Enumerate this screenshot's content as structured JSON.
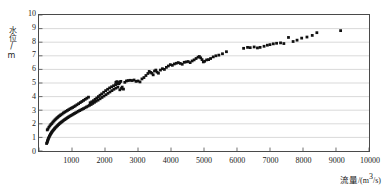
{
  "chart_data": {
    "type": "scatter",
    "title": "",
    "xlabel": "流量 /(m³/s)",
    "ylabel": "水位/m",
    "xlim": [
      0,
      10000
    ],
    "ylim": [
      0,
      10
    ],
    "xticks": [
      0,
      1000,
      2000,
      3000,
      4000,
      5000,
      6000,
      7000,
      8000,
      9000,
      10000
    ],
    "xtick_labels": [
      "0",
      "1000",
      "2000",
      "3000",
      "4000",
      "5000",
      "6000",
      "7000",
      "8000",
      "9000",
      "10000"
    ],
    "yticks": [
      0,
      1,
      2,
      3,
      4,
      5,
      6,
      7,
      8,
      9,
      10
    ],
    "ytick_labels": [
      "0",
      "1",
      "2",
      "3",
      "4",
      "5",
      "6",
      "7",
      "8",
      "9",
      "10"
    ],
    "grid": "horizontal",
    "grid_color": "#c8c8c8",
    "marker_color": "#111111",
    "marker_size": 1.4,
    "legend": null,
    "annotations": [],
    "series": [
      {
        "name": "rising-limb",
        "points": [
          [
            250,
            1.55
          ],
          [
            270,
            1.62
          ],
          [
            300,
            1.75
          ],
          [
            330,
            1.85
          ],
          [
            360,
            1.95
          ],
          [
            390,
            2.02
          ],
          [
            420,
            2.12
          ],
          [
            450,
            2.2
          ],
          [
            480,
            2.28
          ],
          [
            510,
            2.35
          ],
          [
            540,
            2.42
          ],
          [
            570,
            2.48
          ],
          [
            600,
            2.55
          ],
          [
            630,
            2.6
          ],
          [
            660,
            2.66
          ],
          [
            700,
            2.72
          ],
          [
            740,
            2.8
          ],
          [
            780,
            2.86
          ],
          [
            820,
            2.92
          ],
          [
            860,
            2.98
          ],
          [
            900,
            3.04
          ],
          [
            940,
            3.1
          ],
          [
            980,
            3.15
          ],
          [
            1020,
            3.2
          ],
          [
            1060,
            3.26
          ],
          [
            1100,
            3.32
          ],
          [
            1150,
            3.4
          ],
          [
            1200,
            3.48
          ],
          [
            1250,
            3.56
          ],
          [
            1300,
            3.64
          ],
          [
            1350,
            3.72
          ],
          [
            1400,
            3.8
          ],
          [
            1450,
            3.88
          ],
          [
            1500,
            3.96
          ],
          [
            1550,
            3.55
          ],
          [
            1600,
            3.62
          ],
          [
            1650,
            3.7
          ],
          [
            1700,
            3.8
          ],
          [
            1750,
            3.9
          ],
          [
            1800,
            4.0
          ],
          [
            1850,
            4.1
          ],
          [
            1900,
            4.2
          ],
          [
            1960,
            4.32
          ],
          [
            2020,
            4.44
          ],
          [
            2080,
            4.54
          ],
          [
            2140,
            4.64
          ],
          [
            2200,
            4.72
          ],
          [
            2260,
            4.8
          ],
          [
            2320,
            4.88
          ],
          [
            2380,
            4.95
          ],
          [
            2440,
            5.02
          ]
        ]
      },
      {
        "name": "falling-limb",
        "points": [
          [
            230,
            0.55
          ],
          [
            245,
            0.62
          ],
          [
            255,
            0.7
          ],
          [
            265,
            0.78
          ],
          [
            275,
            0.85
          ],
          [
            285,
            0.92
          ],
          [
            300,
            1.0
          ],
          [
            315,
            1.08
          ],
          [
            330,
            1.15
          ],
          [
            345,
            1.22
          ],
          [
            360,
            1.28
          ],
          [
            375,
            1.34
          ],
          [
            390,
            1.4
          ],
          [
            410,
            1.46
          ],
          [
            430,
            1.52
          ],
          [
            450,
            1.58
          ],
          [
            470,
            1.64
          ],
          [
            490,
            1.7
          ],
          [
            515,
            1.76
          ],
          [
            540,
            1.82
          ],
          [
            565,
            1.88
          ],
          [
            590,
            1.94
          ],
          [
            615,
            2.0
          ],
          [
            640,
            2.05
          ],
          [
            665,
            2.1
          ],
          [
            690,
            2.15
          ],
          [
            720,
            2.2
          ],
          [
            750,
            2.26
          ],
          [
            780,
            2.31
          ],
          [
            810,
            2.36
          ],
          [
            840,
            2.41
          ],
          [
            870,
            2.46
          ],
          [
            900,
            2.51
          ],
          [
            935,
            2.56
          ],
          [
            970,
            2.61
          ],
          [
            1005,
            2.66
          ],
          [
            1040,
            2.71
          ],
          [
            1075,
            2.76
          ],
          [
            1110,
            2.81
          ],
          [
            1150,
            2.86
          ],
          [
            1190,
            2.92
          ],
          [
            1230,
            2.97
          ],
          [
            1270,
            3.02
          ],
          [
            1310,
            3.07
          ],
          [
            1350,
            3.12
          ],
          [
            1395,
            3.18
          ],
          [
            1440,
            3.24
          ],
          [
            1485,
            3.3
          ],
          [
            1530,
            3.36
          ],
          [
            1580,
            3.42
          ],
          [
            1630,
            3.5
          ],
          [
            1680,
            3.58
          ],
          [
            1730,
            3.66
          ],
          [
            1790,
            3.74
          ],
          [
            1850,
            3.84
          ],
          [
            1910,
            3.94
          ],
          [
            1970,
            4.04
          ],
          [
            2030,
            4.14
          ],
          [
            2090,
            4.24
          ],
          [
            2150,
            4.34
          ],
          [
            2210,
            4.44
          ],
          [
            2270,
            4.54
          ],
          [
            2330,
            4.62
          ],
          [
            2390,
            4.7
          ],
          [
            2450,
            4.5
          ],
          [
            2500,
            4.6
          ]
        ]
      },
      {
        "name": "main-rating-curve",
        "points": [
          [
            2330,
            5.05
          ],
          [
            2360,
            5.1
          ],
          [
            2390,
            5.02
          ],
          [
            2420,
            4.95
          ],
          [
            2450,
            5.08
          ],
          [
            2480,
            5.12
          ],
          [
            2520,
            4.7
          ],
          [
            2560,
            4.55
          ],
          [
            2600,
            5.05
          ],
          [
            2650,
            5.15
          ],
          [
            2700,
            5.18
          ],
          [
            2760,
            5.2
          ],
          [
            2820,
            5.18
          ],
          [
            2880,
            5.22
          ],
          [
            2940,
            5.12
          ],
          [
            3000,
            5.15
          ],
          [
            3060,
            5.08
          ],
          [
            3120,
            5.3
          ],
          [
            3180,
            5.4
          ],
          [
            3240,
            5.55
          ],
          [
            3300,
            5.7
          ],
          [
            3340,
            5.85
          ],
          [
            3380,
            5.78
          ],
          [
            3420,
            5.72
          ],
          [
            3460,
            5.6
          ],
          [
            3500,
            5.88
          ],
          [
            3540,
            5.95
          ],
          [
            3580,
            5.8
          ],
          [
            3620,
            5.72
          ],
          [
            3680,
            5.95
          ],
          [
            3740,
            6.05
          ],
          [
            3800,
            6.0
          ],
          [
            3860,
            6.15
          ],
          [
            3920,
            6.25
          ],
          [
            3980,
            6.35
          ],
          [
            4040,
            6.3
          ],
          [
            4100,
            6.4
          ],
          [
            4160,
            6.45
          ],
          [
            4220,
            6.5
          ],
          [
            4280,
            6.44
          ],
          [
            4340,
            6.38
          ],
          [
            4400,
            6.52
          ],
          [
            4460,
            6.55
          ],
          [
            4520,
            6.58
          ],
          [
            4580,
            6.5
          ],
          [
            4640,
            6.62
          ],
          [
            4700,
            6.7
          ],
          [
            4760,
            6.8
          ],
          [
            4820,
            6.9
          ],
          [
            4860,
            6.95
          ],
          [
            4900,
            6.85
          ],
          [
            4940,
            6.72
          ],
          [
            4980,
            6.55
          ],
          [
            5020,
            6.6
          ],
          [
            5080,
            6.7
          ],
          [
            5140,
            6.72
          ],
          [
            5200,
            6.8
          ],
          [
            5280,
            6.92
          ],
          [
            5360,
            7.0
          ],
          [
            5450,
            7.05
          ],
          [
            5560,
            7.15
          ],
          [
            5680,
            7.3
          ],
          [
            6200,
            7.55
          ],
          [
            6320,
            7.62
          ],
          [
            6400,
            7.6
          ],
          [
            6520,
            7.65
          ],
          [
            6620,
            7.58
          ],
          [
            6700,
            7.62
          ],
          [
            6820,
            7.7
          ],
          [
            6920,
            7.78
          ],
          [
            7000,
            7.82
          ],
          [
            7100,
            7.88
          ],
          [
            7200,
            7.92
          ],
          [
            7320,
            7.95
          ],
          [
            7420,
            7.9
          ],
          [
            7560,
            8.35
          ],
          [
            7700,
            8.05
          ],
          [
            7820,
            8.15
          ],
          [
            7960,
            8.3
          ],
          [
            8120,
            8.38
          ],
          [
            8280,
            8.5
          ],
          [
            8420,
            8.7
          ],
          [
            9140,
            8.85
          ]
        ]
      }
    ]
  },
  "axis": {
    "xlabel_main": "流量",
    "xlabel_unit_open": "/(m",
    "xlabel_unit_sup": "3",
    "xlabel_unit_close": "/s)",
    "ylabel_text": "水位/m"
  }
}
